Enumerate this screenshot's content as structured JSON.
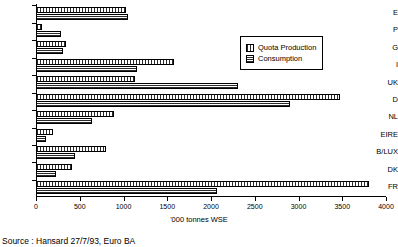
{
  "chart_data": {
    "type": "bar",
    "orientation": "horizontal",
    "title": "",
    "xlabel": "'000 tonnes WSE",
    "ylabel": "",
    "xlim": [
      0,
      4000
    ],
    "xticks": [
      0,
      500,
      1000,
      1500,
      2000,
      2500,
      3000,
      3500,
      4000
    ],
    "xtick_labels": [
      "0",
      "500",
      "1000",
      "1500",
      "2000",
      "2500",
      "3000",
      "3500",
      "4000"
    ],
    "grid": false,
    "legend_position": "upper-right-inside",
    "categories": [
      "E",
      "P",
      "G",
      "I",
      "UK",
      "D",
      "NL",
      "EIRE",
      "B/LUX",
      "DK",
      "FR"
    ],
    "series": [
      {
        "name": "Quota Production",
        "pattern": "vertical-hatch",
        "values": [
          1030,
          70,
          340,
          1580,
          1130,
          3470,
          890,
          190,
          800,
          410,
          3810
        ]
      },
      {
        "name": "Consumption",
        "pattern": "horizontal-hatch",
        "values": [
          1050,
          280,
          310,
          1150,
          2310,
          2900,
          640,
          115,
          450,
          230,
          2070
        ]
      }
    ]
  },
  "legend": {
    "entries": [
      {
        "label": "Quota Production"
      },
      {
        "label": "Consumption"
      }
    ]
  },
  "axis_title": "'000 tonnes WSE",
  "source_note": "Source : Hansard 27/7/93, Euro BA"
}
